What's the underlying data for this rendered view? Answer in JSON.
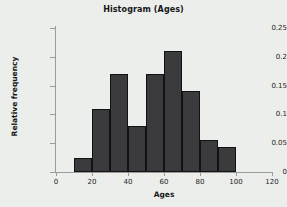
{
  "chart_data": {
    "type": "bar",
    "title": "Histogram (Ages)",
    "xlabel": "Ages",
    "ylabel": "Relative frequency",
    "xlim": [
      0,
      120
    ],
    "ylim": [
      0,
      0.25
    ],
    "grid": false,
    "legend": null,
    "bin_width": 10,
    "bin_edges": [
      10,
      20,
      30,
      40,
      50,
      60,
      70,
      80,
      90,
      100
    ],
    "categories": [
      "10-20",
      "20-30",
      "30-40",
      "40-50",
      "50-60",
      "60-70",
      "70-80",
      "80-90",
      "90-100"
    ],
    "x": [
      10,
      20,
      30,
      40,
      50,
      60,
      70,
      80,
      90
    ],
    "values": [
      0.025,
      0.11,
      0.17,
      0.08,
      0.17,
      0.21,
      0.14,
      0.055,
      0.043
    ],
    "xticks": [
      0,
      20,
      40,
      60,
      80,
      100,
      120
    ],
    "xtick_labels": [
      "0",
      "20",
      "40",
      "60",
      "80",
      "100",
      "120"
    ],
    "yticks": [
      0,
      0.05,
      0.1,
      0.15,
      0.2,
      0.25
    ],
    "ytick_labels": [
      "0",
      "0.05",
      "0.1",
      "0.15",
      "0.2",
      "0.25"
    ],
    "bar_color": "#3b3b3d",
    "bar_edge_color": "#111214",
    "background_color": "#eceeeb",
    "axis_color": "#9a9c9b",
    "text_color": "#16171a"
  }
}
